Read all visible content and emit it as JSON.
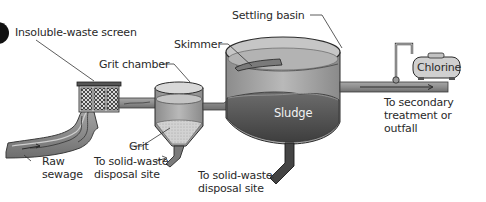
{
  "diagram": {
    "type": "process-flow",
    "colors": {
      "background": "#ffffff",
      "pipe_fill": "#8a8a8a",
      "pipe_dark": "#4a4a4a",
      "tank_light": "#bdbdbd",
      "water_mid": "#9a9a9a",
      "sludge": "#5e5e5e",
      "outline": "#2b2b2b",
      "text": "#2a2a2a"
    },
    "labels": {
      "insoluble_waste_screen": "Insoluble-waste screen",
      "grit_chamber": "Grit chamber",
      "skimmer": "Skimmer",
      "settling_basin": "Settling basin",
      "chlorine": "Chlorine",
      "sludge": "Sludge",
      "grit": "Grit",
      "raw_sewage": "Raw\nsewage",
      "grit_disposal": "To solid-waste\ndisposal site",
      "sludge_disposal": "To solid-waste\ndisposal site",
      "outflow": "To secondary\ntreatment or\noutfall"
    },
    "nodes": [
      {
        "id": "raw-sewage",
        "label": "Raw sewage"
      },
      {
        "id": "screen",
        "label": "Insoluble-waste screen"
      },
      {
        "id": "grit-chamber",
        "label": "Grit chamber"
      },
      {
        "id": "settling-basin",
        "label": "Settling basin"
      },
      {
        "id": "chlorine",
        "label": "Chlorine"
      },
      {
        "id": "outflow",
        "label": "To secondary treatment or outfall"
      }
    ],
    "edges": [
      {
        "from": "raw-sewage",
        "to": "screen"
      },
      {
        "from": "screen",
        "to": "grit-chamber"
      },
      {
        "from": "grit-chamber",
        "to": "settling-basin"
      },
      {
        "from": "grit-chamber",
        "to": "grit-disposal",
        "label": "To solid-waste disposal site"
      },
      {
        "from": "settling-basin",
        "to": "sludge-disposal",
        "label": "To solid-waste disposal site"
      },
      {
        "from": "chlorine",
        "to": "outflow"
      },
      {
        "from": "settling-basin",
        "to": "outflow"
      }
    ]
  }
}
